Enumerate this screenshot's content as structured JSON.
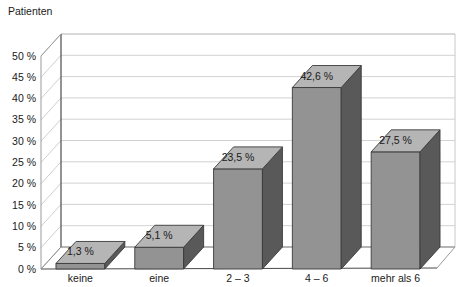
{
  "chart_data": {
    "type": "bar",
    "title": "",
    "subtitle": "",
    "xlabel": "",
    "ylabel": "Patienten",
    "categories": [
      "keine",
      "eine",
      "2 – 3",
      "4 – 6",
      "mehr als 6"
    ],
    "values": [
      1.3,
      5.1,
      23.5,
      42.6,
      27.5
    ],
    "value_labels": [
      "1,3 %",
      "5,1 %",
      "23,5 %",
      "42,6 %",
      "27,5 %"
    ],
    "ylim": [
      0,
      50
    ],
    "ytick_values": [
      0,
      5,
      10,
      15,
      20,
      25,
      30,
      35,
      40,
      45,
      50
    ],
    "ytick_labels": [
      "0 %",
      "5 %",
      "10 %",
      "15 %",
      "20 %",
      "25 %",
      "30 %",
      "35 %",
      "40 %",
      "45 %",
      "50 %"
    ],
    "grid": true,
    "grid_axis": "y",
    "legend": false,
    "legend_position": "none",
    "three_d": true,
    "colors": {
      "bar_front": "#939393",
      "bar_side": "#595959",
      "bar_top": "#b5b5b5",
      "bar_outline": "#3a3a3a",
      "gridline": "#d2d2d2",
      "axis": "#4a4a4a",
      "wall": "#ffffff",
      "floor": "#ffffff",
      "background": "#ffffff",
      "text": "#1a1a1a"
    }
  },
  "axis": {
    "y_title": "Patienten"
  }
}
